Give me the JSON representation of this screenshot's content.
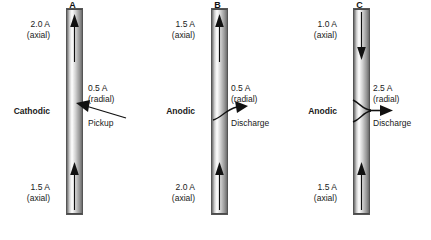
{
  "figure": {
    "type": "technical-diagram",
    "colors": {
      "text": "#1a1a1a",
      "tube_light": "#fdfdfd",
      "tube_dark": "#6b6b6b",
      "outline": "#555555"
    }
  },
  "units": "A",
  "panels": [
    {
      "letter": "A",
      "mode": "Cathodic",
      "top_current": "2.0 A",
      "top_qualifier": "(axial)",
      "top_arrow_direction": "up",
      "bottom_current": "1.5 A",
      "bottom_qualifier": "(axial)",
      "bottom_arrow_direction": "up",
      "radial_current": "0.5 A",
      "radial_qualifier": "(radial)",
      "radial_action": "Pickup",
      "radial_direction": "into-tube",
      "connector_style": "straight"
    },
    {
      "letter": "B",
      "mode": "Anodic",
      "top_current": "1.5 A",
      "top_qualifier": "(axial)",
      "top_arrow_direction": "up",
      "bottom_current": "2.0 A",
      "bottom_qualifier": "(axial)",
      "bottom_arrow_direction": "up",
      "radial_current": "0.5 A",
      "radial_qualifier": "(radial)",
      "radial_action": "Discharge",
      "radial_direction": "out-of-tube",
      "connector_style": "curved"
    },
    {
      "letter": "C",
      "mode": "Anodic",
      "top_current": "1.0 A",
      "top_qualifier": "(axial)",
      "top_arrow_direction": "down",
      "bottom_current": "1.5 A",
      "bottom_qualifier": "(axial)",
      "bottom_arrow_direction": "up",
      "radial_current": "2.5 A",
      "radial_qualifier": "(radial)",
      "radial_action": "Discharge",
      "radial_direction": "out-of-tube",
      "connector_style": "hooked"
    }
  ]
}
